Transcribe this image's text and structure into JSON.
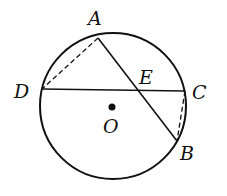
{
  "diagram": {
    "type": "circle-geometry",
    "circle": {
      "center": "O",
      "cx": 113,
      "cy": 106,
      "r": 73
    },
    "points": {
      "A": {
        "label": "A",
        "x": 98,
        "y": 38,
        "lx": 88,
        "ly": 25
      },
      "B": {
        "label": "B",
        "x": 177,
        "y": 141,
        "lx": 180,
        "ly": 160
      },
      "C": {
        "label": "C",
        "x": 185,
        "y": 91,
        "lx": 192,
        "ly": 99
      },
      "D": {
        "label": "D",
        "x": 42,
        "y": 89,
        "lx": 14,
        "ly": 98
      },
      "E": {
        "label": "E",
        "x": 137,
        "y": 90,
        "lx": 139,
        "ly": 84
      },
      "O": {
        "label": "O",
        "x": 112,
        "y": 107,
        "lx": 103,
        "ly": 133
      }
    },
    "segments": [
      {
        "from": "A",
        "to": "B",
        "style": "solid"
      },
      {
        "from": "D",
        "to": "C",
        "style": "solid"
      },
      {
        "from": "A",
        "to": "D",
        "style": "dashed"
      },
      {
        "from": "C",
        "to": "B",
        "style": "dashed"
      }
    ],
    "colors": {
      "stroke": "#111111",
      "background": "#ffffff"
    }
  }
}
